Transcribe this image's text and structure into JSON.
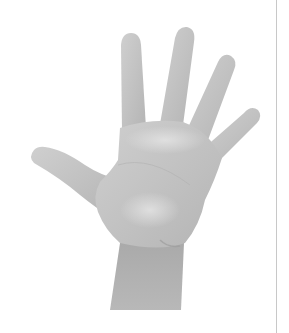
{
  "image": {
    "subject": "open hand raised, palm facing viewer, five fingers spread",
    "alt": "Grayscale photo of a raised open hand with palm facing forward",
    "style": "grayscale photograph on white background",
    "colors": {
      "background": "#ffffff",
      "skin_light": "#dcdcdc",
      "skin_mid": "#c4c4c4",
      "skin_shadow": "#a8a8a8",
      "edge_line": "#c8c8c8"
    }
  }
}
